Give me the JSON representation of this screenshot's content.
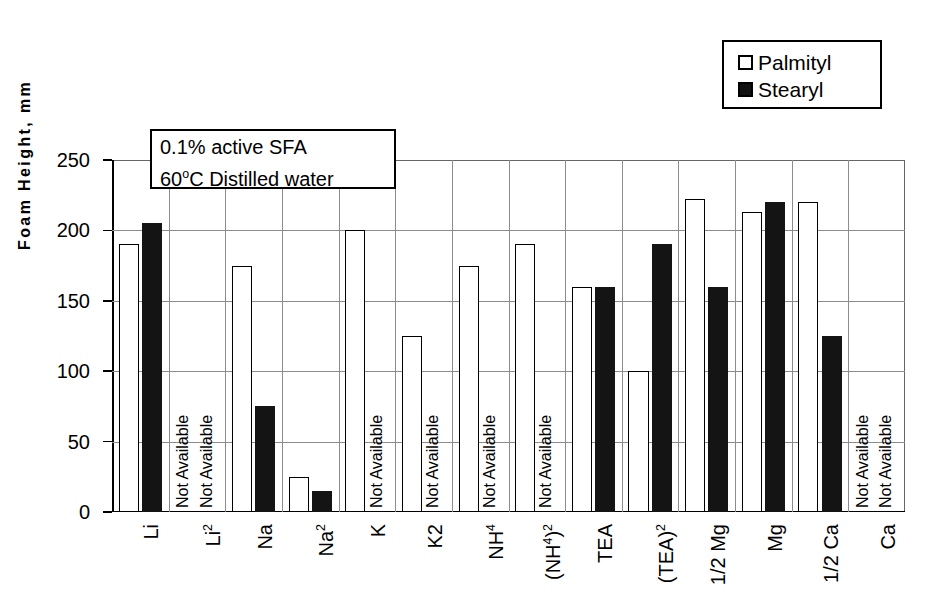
{
  "chart_data": {
    "type": "bar",
    "title": "",
    "xlabel": "",
    "ylabel": "Foam Height, mm",
    "ylim": [
      0,
      250
    ],
    "yticks": [
      0,
      50,
      100,
      150,
      200,
      250
    ],
    "grid": true,
    "legend_position": "top-right",
    "missing_label": "Not Available",
    "categories": [
      "Li",
      "Li2",
      "Na",
      "Na2",
      "K",
      "K2",
      "NH4",
      "(NH4)2",
      "TEA",
      "(TEA)2",
      "1/2 Mg",
      "Mg",
      "1/2 Ca",
      "Ca"
    ],
    "category_labels_html": [
      "Li",
      "Li<sup>2</sup>",
      "Na",
      "Na<sup>2</sup>",
      "K",
      "K2",
      "NH<sup>4</sup>",
      "(NH<sup>4</sup>)<sup>2</sup>",
      "TEA",
      "(TEA)<sup>2</sup>",
      "1/2 Mg",
      "Mg",
      "1/2 Ca",
      "Ca"
    ],
    "series": [
      {
        "name": "Palmityl",
        "style": "open",
        "values": [
          190,
          null,
          175,
          25,
          200,
          125,
          175,
          190,
          160,
          100,
          222,
          213,
          220,
          null
        ]
      },
      {
        "name": "Stearyl",
        "style": "filled",
        "values": [
          205,
          null,
          75,
          15,
          null,
          null,
          null,
          null,
          160,
          190,
          160,
          220,
          125,
          null
        ]
      }
    ],
    "annotation": {
      "line1": "0.1% active SFA",
      "line2_prefix": "60",
      "line2_sup": "o",
      "line2_suffix": "C Distilled water"
    }
  },
  "legend": {
    "items": [
      {
        "label": "Palmityl",
        "style": "open"
      },
      {
        "label": "Stearyl",
        "style": "filled"
      }
    ]
  },
  "colors": {
    "palmityl_fill": "#ffffff",
    "stearyl_fill": "#141414",
    "axis": "#000000",
    "grid": "#8c8c8c",
    "background": "#ffffff"
  }
}
